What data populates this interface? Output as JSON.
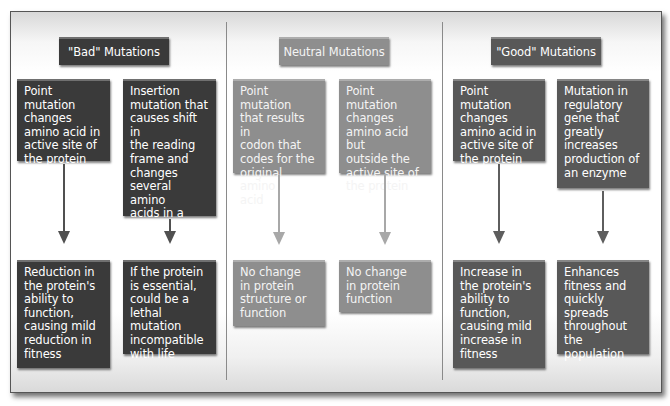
{
  "columns": [
    {
      "id": "bad",
      "title": "\"Bad\" Mutations",
      "causes": [
        "Point mutation\nchanges\namino acid in\nactive site of\nthe protein",
        "Insertion\nmutation that\ncauses shift in\nthe reading\nframe and\nchanges\nseveral amino\nacids in a\nprotein"
      ],
      "effects": [
        "Reduction in\nthe protein's\nability to\nfunction,\ncausing mild\nreduction in\nfitness",
        "If the protein\nis essential,\ncould be a\nlethal mutation\nincompatible\nwith life"
      ]
    },
    {
      "id": "neutral",
      "title": "Neutral Mutations",
      "causes": [
        "Point mutation\nthat results in\ncodon that\ncodes for the\noriginal amino\nacid",
        "Point mutation\nchanges\namino acid but\noutside the\nactive site of\nthe protein"
      ],
      "effects": [
        "No change\nin protein\nstructure or\nfunction",
        "No change\nin protein\nfunction"
      ]
    },
    {
      "id": "good",
      "title": "\"Good\" Mutations",
      "causes": [
        "Point mutation\nchanges\namino acid in\nactive site of\nthe protein",
        "Mutation in\nregulatory\ngene that\ngreatly\nincreases\nproduction of\nan enzyme"
      ],
      "effects": [
        "Increase in\nthe protein's\nability to\nfunction,\ncausing mild\nincrease in\nfitness",
        "Enhances\nfitness and\nquickly\nspreads\nthroughout the\npopulation"
      ]
    }
  ],
  "colors": {
    "bad": "#3a3a3a",
    "neutral": "#8e8e8e",
    "good": "#585858",
    "separator": "#8a8a8a"
  }
}
